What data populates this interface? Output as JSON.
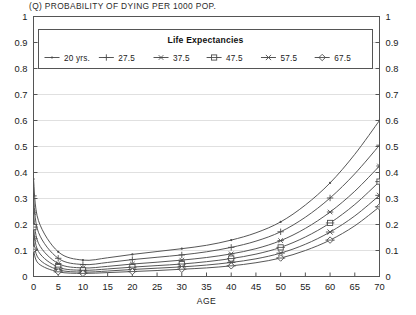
{
  "chart_data": {
    "type": "line",
    "title": "(Q) PROBABILITY OF DYING PER 1000 POP.",
    "xlabel": "AGE",
    "ylabel": "",
    "xlim": [
      0,
      70
    ],
    "ylim": [
      0,
      1
    ],
    "grid": true,
    "legend_position": "top-left-inside",
    "legend_title": "Life Expectancies",
    "x_ticks": [
      0,
      5,
      10,
      15,
      20,
      25,
      30,
      35,
      40,
      45,
      50,
      55,
      60,
      65,
      70
    ],
    "y_ticks": [
      "0",
      "0.1",
      "0.2",
      "0.3",
      "0.4",
      "0.5",
      "0.6",
      "0.7",
      "0.8",
      "0.9",
      "1"
    ],
    "y_ticks_right": [
      "0",
      "0.1",
      "0.2",
      "0.3",
      "0.4",
      "0.5",
      "0.6",
      "0.7",
      "0.8",
      "0.9",
      "1"
    ],
    "x": [
      0,
      1,
      5,
      10,
      15,
      20,
      25,
      30,
      35,
      40,
      45,
      50,
      55,
      60,
      65,
      70
    ],
    "series": [
      {
        "name": "20 yrs.",
        "marker": "dot",
        "values": [
          0.375,
          0.215,
          0.095,
          0.063,
          0.072,
          0.085,
          0.096,
          0.107,
          0.12,
          0.14,
          0.168,
          0.21,
          0.275,
          0.36,
          0.47,
          0.6
        ]
      },
      {
        "name": "27.5",
        "marker": "plus",
        "values": [
          0.31,
          0.17,
          0.07,
          0.046,
          0.054,
          0.065,
          0.074,
          0.083,
          0.095,
          0.112,
          0.136,
          0.172,
          0.228,
          0.302,
          0.395,
          0.505
        ]
      },
      {
        "name": "37.5",
        "marker": "asterisk",
        "values": [
          0.245,
          0.128,
          0.05,
          0.033,
          0.039,
          0.048,
          0.055,
          0.063,
          0.073,
          0.087,
          0.107,
          0.138,
          0.185,
          0.248,
          0.328,
          0.425
        ]
      },
      {
        "name": "47.5",
        "marker": "square",
        "values": [
          0.19,
          0.096,
          0.036,
          0.024,
          0.029,
          0.036,
          0.042,
          0.048,
          0.057,
          0.069,
          0.086,
          0.112,
          0.152,
          0.206,
          0.277,
          0.365
        ]
      },
      {
        "name": "57.5",
        "marker": "x",
        "values": [
          0.145,
          0.07,
          0.026,
          0.017,
          0.021,
          0.027,
          0.032,
          0.037,
          0.044,
          0.054,
          0.068,
          0.09,
          0.124,
          0.171,
          0.233,
          0.312
        ]
      },
      {
        "name": "67.5",
        "marker": "diamond",
        "values": [
          0.105,
          0.05,
          0.018,
          0.012,
          0.015,
          0.019,
          0.023,
          0.028,
          0.033,
          0.041,
          0.053,
          0.071,
          0.1,
          0.14,
          0.195,
          0.268
        ]
      }
    ],
    "colors": {
      "line": "#4d4d4d",
      "grid": "#d8d8d8",
      "axis": "#555555",
      "text": "#1a1a1a"
    }
  }
}
